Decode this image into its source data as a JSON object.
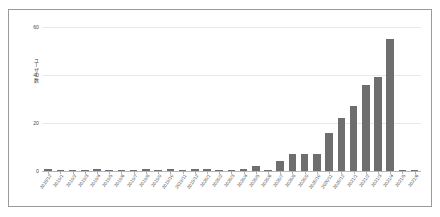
{
  "chart_data": {
    "type": "bar",
    "title": "",
    "xlabel": "",
    "ylabel": "ユーザー数",
    "ylim": [
      0,
      60
    ],
    "yticks": [
      0,
      20,
      40,
      60
    ],
    "ytick_labels": [
      "0",
      "20",
      "40",
      "60"
    ],
    "grid": true,
    "legend": "none",
    "bar_color": "#6e6e6e",
    "categories": [
      "2018/12",
      "2019/1",
      "2019/2",
      "2019/3",
      "2019/4",
      "2019/5",
      "2019/6",
      "2019/7",
      "2019/8",
      "2019/9",
      "2019/10",
      "2019/11",
      "2019/12",
      "2020/1",
      "2020/2",
      "2020/3",
      "2020/4",
      "2020/5",
      "2020/6",
      "2020/7",
      "2020/8",
      "2020/9",
      "2020/10",
      "2020/11",
      "2020/12",
      "2021/1",
      "2021/2",
      "2021/3",
      "2021/4",
      "2021/5",
      "2021/6"
    ],
    "values": [
      1,
      0,
      0,
      0,
      1,
      0,
      0,
      0,
      1,
      0,
      1,
      0,
      1,
      1,
      0,
      0,
      1,
      2,
      0,
      4,
      7,
      7,
      7,
      16,
      22,
      27,
      36,
      39,
      55,
      0,
      0
    ]
  },
  "axis": {
    "ylabel_text": "ユーザー数"
  }
}
